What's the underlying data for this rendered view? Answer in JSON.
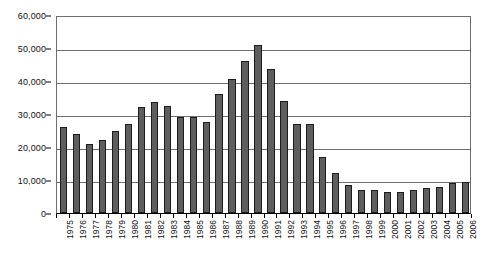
{
  "chart_data": {
    "type": "bar",
    "title": "",
    "subtitle": "",
    "xlabel": "",
    "ylabel": "",
    "categories": [
      "1975",
      "1976",
      "1977",
      "1978",
      "1979",
      "1980",
      "1981",
      "1982",
      "1983",
      "1984",
      "1985",
      "1986",
      "1987",
      "1988",
      "1989",
      "1990",
      "1991",
      "1992",
      "1993",
      "1994",
      "1995",
      "1996",
      "1997",
      "1998",
      "1999",
      "2000",
      "2001",
      "2002",
      "2003",
      "2004",
      "2005",
      "2006"
    ],
    "values": [
      26000,
      24000,
      21000,
      22000,
      25000,
      27000,
      32000,
      33500,
      32500,
      29000,
      29000,
      27500,
      36000,
      40500,
      46000,
      51000,
      43500,
      34000,
      27000,
      27000,
      17000,
      12000,
      8500,
      7000,
      7000,
      6500,
      6500,
      7000,
      7500,
      8000,
      9000,
      9500
    ],
    "ylim": [
      0,
      60000
    ],
    "ytick_values": [
      0,
      10000,
      20000,
      30000,
      40000,
      50000,
      60000
    ],
    "ytick_labels": [
      "0",
      "10,000",
      "20,000",
      "30,000",
      "40,000",
      "50,000",
      "60,000"
    ],
    "grid": true,
    "legend": false,
    "legend_position": "none",
    "series": [
      {
        "name": "",
        "color": "#5e5e5e",
        "values": [
          26000,
          24000,
          21000,
          22000,
          25000,
          27000,
          32000,
          33500,
          32500,
          29000,
          29000,
          27500,
          36000,
          40500,
          46000,
          51000,
          43500,
          34000,
          27000,
          27000,
          17000,
          12000,
          8500,
          7000,
          7000,
          6500,
          6500,
          7000,
          7500,
          8000,
          9000,
          9500
        ]
      }
    ]
  },
  "colors": {
    "bar_fill": "#5e5e5e",
    "bar_border": "#1c1c1c",
    "gridline": "#6e6e6e",
    "axis": "#000000",
    "background": "#ffffff"
  }
}
